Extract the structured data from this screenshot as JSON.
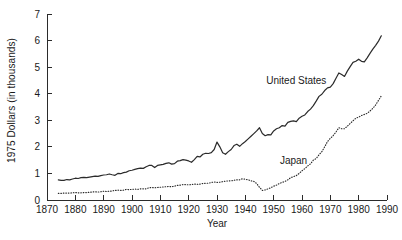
{
  "chart_data": {
    "type": "line",
    "title": "",
    "subtitle": "",
    "xlabel": "Year",
    "ylabel": "1975 Dollars (in thousands)",
    "xlim": [
      1870,
      1990
    ],
    "ylim": [
      0,
      7
    ],
    "xticks": [
      1870,
      1880,
      1890,
      1900,
      1910,
      1920,
      1930,
      1940,
      1950,
      1960,
      1970,
      1980,
      1990
    ],
    "yticks": [
      0,
      1,
      2,
      3,
      4,
      5,
      6,
      7
    ],
    "xtick_labels": [
      "1870",
      "1880",
      "1890",
      "1900",
      "1910",
      "1920",
      "1930",
      "1940",
      "1950",
      "1960",
      "1970",
      "1980",
      "1990"
    ],
    "ytick_labels": [
      "0",
      "1",
      "2",
      "3",
      "4",
      "5",
      "6",
      "7"
    ],
    "grid": false,
    "legend": "inline-annotations",
    "annotations": [
      {
        "text": "United States",
        "x": 1958,
        "y": 4.35
      },
      {
        "text": "Japan",
        "x": 1957,
        "y": 1.35
      }
    ],
    "series": [
      {
        "name": "United States",
        "style": "solid",
        "color": "#2b2b2b",
        "x": [
          1874,
          1875,
          1876,
          1877,
          1878,
          1879,
          1880,
          1881,
          1882,
          1883,
          1884,
          1885,
          1886,
          1887,
          1888,
          1889,
          1890,
          1891,
          1892,
          1893,
          1894,
          1895,
          1896,
          1897,
          1898,
          1899,
          1900,
          1901,
          1902,
          1903,
          1904,
          1905,
          1906,
          1907,
          1908,
          1909,
          1910,
          1911,
          1912,
          1913,
          1914,
          1915,
          1916,
          1917,
          1918,
          1919,
          1920,
          1921,
          1922,
          1923,
          1924,
          1925,
          1926,
          1927,
          1928,
          1929,
          1930,
          1931,
          1932,
          1933,
          1934,
          1935,
          1936,
          1937,
          1938,
          1939,
          1940,
          1941,
          1942,
          1943,
          1944,
          1945,
          1946,
          1947,
          1948,
          1949,
          1950,
          1951,
          1952,
          1953,
          1954,
          1955,
          1956,
          1957,
          1958,
          1959,
          1960,
          1961,
          1962,
          1963,
          1964,
          1965,
          1966,
          1967,
          1968,
          1969,
          1970,
          1971,
          1972,
          1973,
          1974,
          1975,
          1976,
          1977,
          1978,
          1979,
          1980,
          1981,
          1982,
          1983,
          1984,
          1985,
          1986,
          1987,
          1988
        ],
        "y": [
          0.76,
          0.74,
          0.74,
          0.77,
          0.76,
          0.79,
          0.82,
          0.81,
          0.84,
          0.85,
          0.84,
          0.86,
          0.88,
          0.9,
          0.89,
          0.92,
          0.94,
          0.95,
          0.98,
          0.95,
          0.93,
          1.0,
          0.99,
          1.03,
          1.05,
          1.1,
          1.12,
          1.15,
          1.18,
          1.2,
          1.19,
          1.25,
          1.3,
          1.3,
          1.22,
          1.3,
          1.32,
          1.34,
          1.38,
          1.4,
          1.35,
          1.37,
          1.46,
          1.48,
          1.52,
          1.5,
          1.47,
          1.42,
          1.52,
          1.64,
          1.62,
          1.72,
          1.76,
          1.75,
          1.78,
          1.9,
          2.18,
          2.0,
          1.78,
          1.72,
          1.82,
          1.9,
          2.05,
          2.1,
          2.02,
          2.12,
          2.2,
          2.3,
          2.4,
          2.5,
          2.6,
          2.72,
          2.5,
          2.42,
          2.46,
          2.45,
          2.6,
          2.68,
          2.72,
          2.8,
          2.78,
          2.92,
          2.96,
          2.98,
          2.95,
          3.08,
          3.15,
          3.2,
          3.33,
          3.42,
          3.55,
          3.72,
          3.9,
          3.98,
          4.12,
          4.22,
          4.25,
          4.38,
          4.58,
          4.78,
          4.72,
          4.65,
          4.85,
          5.02,
          5.18,
          5.22,
          5.3,
          5.22,
          5.2,
          5.35,
          5.52,
          5.68,
          5.82,
          5.98,
          6.18
        ]
      },
      {
        "name": "Japan",
        "style": "dotted",
        "color": "#2b2b2b",
        "x": [
          1874,
          1875,
          1876,
          1877,
          1878,
          1879,
          1880,
          1881,
          1882,
          1883,
          1884,
          1885,
          1886,
          1887,
          1888,
          1889,
          1890,
          1891,
          1892,
          1893,
          1894,
          1895,
          1896,
          1897,
          1898,
          1899,
          1900,
          1901,
          1902,
          1903,
          1904,
          1905,
          1906,
          1907,
          1908,
          1909,
          1910,
          1911,
          1912,
          1913,
          1914,
          1915,
          1916,
          1917,
          1918,
          1919,
          1920,
          1921,
          1922,
          1923,
          1924,
          1925,
          1926,
          1927,
          1928,
          1929,
          1930,
          1931,
          1932,
          1933,
          1934,
          1935,
          1936,
          1937,
          1938,
          1939,
          1940,
          1941,
          1942,
          1943,
          1944,
          1945,
          1946,
          1947,
          1948,
          1949,
          1950,
          1951,
          1952,
          1953,
          1954,
          1955,
          1956,
          1957,
          1958,
          1959,
          1960,
          1961,
          1962,
          1963,
          1964,
          1965,
          1966,
          1967,
          1968,
          1969,
          1970,
          1971,
          1972,
          1973,
          1974,
          1975,
          1976,
          1977,
          1978,
          1979,
          1980,
          1981,
          1982,
          1983,
          1984,
          1985,
          1986,
          1987,
          1988
        ],
        "y": [
          0.25,
          0.25,
          0.26,
          0.26,
          0.26,
          0.27,
          0.28,
          0.27,
          0.27,
          0.28,
          0.28,
          0.29,
          0.3,
          0.31,
          0.3,
          0.31,
          0.33,
          0.32,
          0.33,
          0.34,
          0.36,
          0.37,
          0.36,
          0.37,
          0.4,
          0.39,
          0.4,
          0.41,
          0.4,
          0.42,
          0.42,
          0.42,
          0.46,
          0.47,
          0.46,
          0.47,
          0.48,
          0.49,
          0.5,
          0.51,
          0.5,
          0.52,
          0.55,
          0.56,
          0.58,
          0.58,
          0.57,
          0.58,
          0.6,
          0.59,
          0.6,
          0.62,
          0.63,
          0.63,
          0.66,
          0.68,
          0.66,
          0.67,
          0.69,
          0.71,
          0.72,
          0.72,
          0.74,
          0.76,
          0.76,
          0.8,
          0.78,
          0.76,
          0.72,
          0.7,
          0.62,
          0.48,
          0.36,
          0.38,
          0.42,
          0.46,
          0.52,
          0.56,
          0.62,
          0.66,
          0.7,
          0.76,
          0.84,
          0.88,
          0.92,
          1.0,
          1.1,
          1.18,
          1.28,
          1.36,
          1.5,
          1.56,
          1.7,
          1.82,
          2.0,
          2.2,
          2.32,
          2.42,
          2.56,
          2.72,
          2.68,
          2.68,
          2.78,
          2.88,
          2.98,
          3.08,
          3.12,
          3.18,
          3.22,
          3.26,
          3.35,
          3.45,
          3.58,
          3.75,
          3.92
        ]
      }
    ]
  }
}
